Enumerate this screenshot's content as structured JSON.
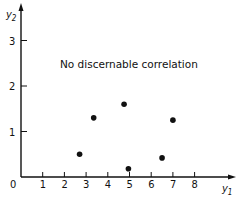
{
  "chart_data": {
    "type": "scatter",
    "title": "",
    "annotation": "No discernable correlation",
    "xlabel": "y1",
    "ylabel": "y2",
    "xlim": [
      0,
      9
    ],
    "ylim": [
      0,
      3.6
    ],
    "x_ticks": [
      0,
      1,
      2,
      3,
      4,
      5,
      6,
      7,
      8
    ],
    "y_ticks": [
      1,
      2,
      3
    ],
    "grid": false,
    "legend": null,
    "series": [
      {
        "name": "points",
        "x": [
          2.7,
          3.35,
          4.75,
          4.95,
          6.5,
          7.0
        ],
        "y": [
          0.5,
          1.3,
          1.6,
          0.18,
          0.42,
          1.25
        ]
      }
    ]
  },
  "labels": {
    "origin": "0",
    "x_axis_main": "y",
    "x_axis_sub": "1",
    "y_axis_main": "y",
    "y_axis_sub": "2",
    "annotation": "No discernable correlation"
  },
  "colors": {
    "ink": "#111111",
    "background": "#ffffff"
  }
}
